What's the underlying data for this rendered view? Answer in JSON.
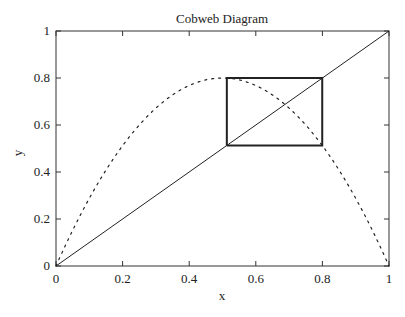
{
  "chart_data": {
    "type": "line",
    "title": "Cobweb Diagram",
    "xlabel": "x",
    "ylabel": "y",
    "xlim": [
      0,
      1
    ],
    "ylim": [
      0,
      1
    ],
    "xticks": [
      "0",
      "0.2",
      "0.4",
      "0.6",
      "0.8",
      "1"
    ],
    "yticks": [
      "0",
      "0.2",
      "0.4",
      "0.6",
      "0.8",
      "1"
    ],
    "grid": false,
    "legend": null,
    "series": [
      {
        "name": "f(x) = 3.2 x (1 - x)",
        "style": "dotted",
        "x": [
          0,
          0.1,
          0.2,
          0.3,
          0.4,
          0.5,
          0.6,
          0.7,
          0.8,
          0.9,
          1
        ],
        "y": [
          0,
          0.288,
          0.512,
          0.672,
          0.768,
          0.8,
          0.768,
          0.672,
          0.512,
          0.288,
          0
        ]
      },
      {
        "name": "y = x",
        "style": "solid-thin",
        "x": [
          0,
          1
        ],
        "y": [
          0,
          1
        ]
      },
      {
        "name": "cobweb 2-cycle",
        "style": "solid-bold",
        "x": [
          0.513,
          0.513,
          0.7995,
          0.7995,
          0.513
        ],
        "y": [
          0.513,
          0.7995,
          0.7995,
          0.513,
          0.513
        ]
      }
    ],
    "colors": {
      "line": "#222222",
      "background": "#ffffff"
    }
  }
}
